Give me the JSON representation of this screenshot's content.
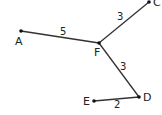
{
  "diagram": {
    "type": "weighted-graph",
    "nodes": [
      {
        "id": "A",
        "label": "A",
        "x": 21,
        "y": 31,
        "lx": 15,
        "ly": 45
      },
      {
        "id": "F",
        "label": "F",
        "x": 99,
        "y": 43,
        "lx": 94,
        "ly": 56
      },
      {
        "id": "C",
        "label": "C",
        "x": 149,
        "y": 2,
        "lx": 153,
        "ly": 6
      },
      {
        "id": "D",
        "label": "D",
        "x": 139,
        "y": 97,
        "lx": 143,
        "ly": 101
      },
      {
        "id": "E",
        "label": "E",
        "x": 94,
        "y": 101,
        "lx": 83,
        "ly": 105
      }
    ],
    "edges": [
      {
        "from": "A",
        "to": "F",
        "weight": "5",
        "wx": 60,
        "wy": 35
      },
      {
        "from": "F",
        "to": "C",
        "weight": "3",
        "wx": 117,
        "wy": 20
      },
      {
        "from": "F",
        "to": "D",
        "weight": "3",
        "wx": 120,
        "wy": 70
      },
      {
        "from": "E",
        "to": "D",
        "weight": "2",
        "wx": 114,
        "wy": 108
      }
    ]
  }
}
